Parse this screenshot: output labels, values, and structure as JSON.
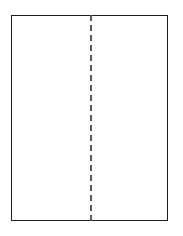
{
  "diagram": {
    "name": "folded-sheet-outline",
    "background_color": "#ffffff",
    "canvas": {
      "width": 183,
      "height": 236
    },
    "sheet": {
      "label": "sheet",
      "fill_color": "#ffffff",
      "border_color": "#1c1c1c",
      "border_width": 1,
      "x": 11,
      "y": 15,
      "width": 157,
      "height": 206
    },
    "fold_line": {
      "label": "fold line",
      "style": "dashed",
      "orientation": "vertical",
      "color": "#5a5a5a",
      "width": 2,
      "dash_length": 8,
      "gap_length": 6,
      "x": 90,
      "y_start": 15,
      "y_end": 221
    }
  }
}
